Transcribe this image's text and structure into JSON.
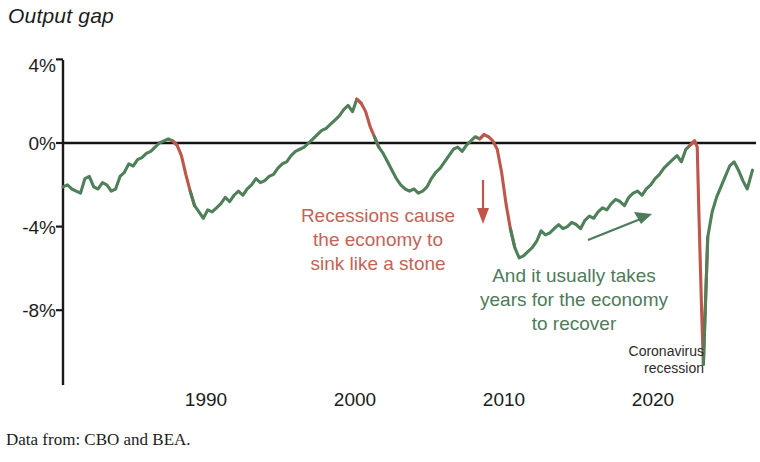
{
  "chart_title": "Output gap",
  "source_note": "Data from: CBO and BEA.",
  "annotations": {
    "recession_text": "Recessions cause\nthe economy to\nsink like a stone",
    "recession_line1": "Recessions cause",
    "recession_line2": "the economy to",
    "recession_line3": "sink like a stone",
    "recovery_line1": "And it usually takes",
    "recovery_line2": "years for the economy",
    "recovery_line3": "to recover",
    "corona_line1": "Coronavirus",
    "corona_line2": "recession"
  },
  "colors": {
    "expansion": "#4f8059",
    "recession": "#c0564a",
    "axis": "#1a1a1a",
    "zero_line": "#141414",
    "annot_red": "#c26456",
    "annot_green": "#4f7a5c",
    "text": "#1c1c1c"
  },
  "chart_data": {
    "type": "line",
    "title": "Output gap",
    "subtitle": "",
    "xlabel": "",
    "ylabel": "Output gap",
    "grid": false,
    "legend": "none",
    "zero_line": 0,
    "xlim": [
      1984.0,
      2023.5
    ],
    "ylim": [
      -11.5,
      4.6
    ],
    "xticks": [
      1990,
      2000,
      2010,
      2020
    ],
    "xtick_labels": [
      "1990",
      "2000",
      "2010",
      "2020"
    ],
    "yticks": [
      4,
      0,
      -4,
      -8
    ],
    "ytick_labels": [
      "4%",
      "0%",
      "-4%",
      "-8%"
    ],
    "units": "percent of potential GDP",
    "recession_spans": [
      [
        1990.5,
        1991.3
      ],
      [
        2001.0,
        2001.9
      ],
      [
        2007.9,
        2009.5
      ],
      [
        2020.0,
        2020.5
      ]
    ],
    "series": [
      {
        "name": "Output gap (CBO/BEA)",
        "x": [
          1984.0,
          1984.25,
          1984.5,
          1984.75,
          1985.0,
          1985.25,
          1985.5,
          1985.75,
          1986.0,
          1986.25,
          1986.5,
          1986.75,
          1987.0,
          1987.25,
          1987.5,
          1987.75,
          1988.0,
          1988.25,
          1988.5,
          1988.75,
          1989.0,
          1989.25,
          1989.5,
          1989.75,
          1990.0,
          1990.25,
          1990.5,
          1990.75,
          1991.0,
          1991.25,
          1991.5,
          1991.75,
          1992.0,
          1992.25,
          1992.5,
          1992.75,
          1993.0,
          1993.25,
          1993.5,
          1993.75,
          1994.0,
          1994.25,
          1994.5,
          1994.75,
          1995.0,
          1995.25,
          1995.5,
          1995.75,
          1996.0,
          1996.25,
          1996.5,
          1996.75,
          1997.0,
          1997.25,
          1997.5,
          1997.75,
          1998.0,
          1998.25,
          1998.5,
          1998.75,
          1999.0,
          1999.25,
          1999.5,
          1999.75,
          2000.0,
          2000.25,
          2000.5,
          2000.75,
          2001.0,
          2001.25,
          2001.5,
          2001.75,
          2002.0,
          2002.25,
          2002.5,
          2002.75,
          2003.0,
          2003.25,
          2003.5,
          2003.75,
          2004.0,
          2004.25,
          2004.5,
          2004.75,
          2005.0,
          2005.25,
          2005.5,
          2005.75,
          2006.0,
          2006.25,
          2006.5,
          2006.75,
          2007.0,
          2007.25,
          2007.5,
          2007.75,
          2008.0,
          2008.25,
          2008.5,
          2008.75,
          2009.0,
          2009.25,
          2009.5,
          2009.75,
          2010.0,
          2010.25,
          2010.5,
          2010.75,
          2011.0,
          2011.25,
          2011.5,
          2011.75,
          2012.0,
          2012.25,
          2012.5,
          2012.75,
          2013.0,
          2013.25,
          2013.5,
          2013.75,
          2014.0,
          2014.25,
          2014.5,
          2014.75,
          2015.0,
          2015.25,
          2015.5,
          2015.75,
          2016.0,
          2016.25,
          2016.5,
          2016.75,
          2017.0,
          2017.25,
          2017.5,
          2017.75,
          2018.0,
          2018.25,
          2018.5,
          2018.75,
          2019.0,
          2019.25,
          2019.5,
          2019.75,
          2020.0,
          2020.15,
          2020.25,
          2020.4,
          2020.5,
          2020.75,
          2021.0,
          2021.25,
          2021.5,
          2021.75,
          2022.0,
          2022.25,
          2022.5,
          2022.75,
          2023.0,
          2023.3
        ],
        "values": [
          -2.1,
          -2.0,
          -2.2,
          -2.3,
          -2.4,
          -1.7,
          -1.6,
          -2.1,
          -2.2,
          -1.9,
          -2.0,
          -2.3,
          -2.2,
          -1.6,
          -1.4,
          -1.0,
          -1.1,
          -0.8,
          -0.7,
          -0.5,
          -0.4,
          -0.2,
          0.0,
          0.1,
          0.2,
          0.1,
          -0.1,
          -0.6,
          -1.5,
          -2.3,
          -3.0,
          -3.3,
          -3.6,
          -3.2,
          -3.3,
          -3.1,
          -2.9,
          -2.6,
          -2.8,
          -2.5,
          -2.3,
          -2.5,
          -2.2,
          -2.0,
          -1.7,
          -1.9,
          -1.8,
          -1.6,
          -1.5,
          -1.2,
          -1.0,
          -0.9,
          -0.6,
          -0.4,
          -0.3,
          -0.2,
          0.0,
          0.2,
          0.4,
          0.6,
          0.7,
          0.9,
          1.1,
          1.3,
          1.6,
          1.8,
          1.5,
          2.1,
          1.9,
          1.5,
          0.8,
          0.3,
          -0.2,
          -0.5,
          -0.9,
          -1.3,
          -1.7,
          -2.0,
          -2.2,
          -2.3,
          -2.2,
          -2.4,
          -2.3,
          -2.1,
          -1.7,
          -1.4,
          -1.2,
          -0.9,
          -0.6,
          -0.3,
          -0.2,
          -0.4,
          -0.1,
          0.1,
          0.3,
          0.2,
          0.4,
          0.3,
          0.1,
          -0.3,
          -1.4,
          -2.9,
          -4.1,
          -5.0,
          -5.5,
          -5.4,
          -5.2,
          -5.0,
          -4.7,
          -4.2,
          -4.4,
          -4.3,
          -4.1,
          -3.9,
          -4.1,
          -4.0,
          -3.8,
          -3.9,
          -4.1,
          -3.7,
          -3.5,
          -3.6,
          -3.3,
          -3.1,
          -3.2,
          -2.9,
          -2.7,
          -2.8,
          -3.0,
          -2.6,
          -2.4,
          -2.3,
          -2.5,
          -2.2,
          -2.0,
          -1.7,
          -1.5,
          -1.2,
          -1.0,
          -0.8,
          -0.6,
          -0.9,
          -0.3,
          -0.1,
          0.1,
          -0.2,
          -3.5,
          -8.0,
          -10.6,
          -4.5,
          -3.3,
          -2.6,
          -2.1,
          -1.6,
          -1.1,
          -0.9,
          -1.3,
          -1.8,
          -2.2,
          -1.3
        ]
      }
    ],
    "annotations": [
      {
        "text": "Recessions cause the economy to sink like a stone",
        "color": "#c26456",
        "x_approx": 2000.5,
        "y_approx": -4.0
      },
      {
        "text": "And it usually takes years for the economy to recover",
        "color": "#4f7a5c",
        "x_approx": 2011.5,
        "y_approx": -6.5
      },
      {
        "text": "Coronavirus recession",
        "color": "#2b2b2b",
        "x_approx": 2019.0,
        "y_approx": -9.6
      }
    ],
    "arrows": [
      {
        "name": "down-arrow",
        "color": "#c0564a",
        "from": [
          2006.2,
          -2.0
        ],
        "to": [
          2006.2,
          -4.0
        ]
      },
      {
        "name": "up-right-arrow",
        "color": "#4f7a5c",
        "from": [
          2012.2,
          -2.6
        ],
        "to": [
          2015.4,
          -1.4
        ]
      }
    ]
  },
  "geometry": {
    "plot_left": 63,
    "plot_right": 756,
    "y_zero_px": 143,
    "px_per_percent": 20.9,
    "axis_top_px": 60,
    "axis_bottom_px": 385
  }
}
